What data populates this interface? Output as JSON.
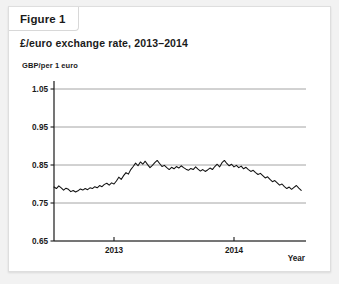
{
  "card": {
    "tab_label": "Figure 1",
    "title": "£/euro exchange rate, 2013–2014"
  },
  "colors": {
    "page_background": "#f2f2f2",
    "card_background": "#ffffff",
    "card_border": "#dedede",
    "gridline": "#9a9a9a",
    "axis": "#1a1a1a",
    "series_line": "#111111",
    "text": "#1a1a1a"
  },
  "chart_data": {
    "type": "line",
    "title": "£/euro exchange rate, 2013–2014",
    "subtitle": "",
    "xlabel": "Year",
    "ylabel": "GBP/per 1 euro",
    "ylim": [
      0.65,
      1.05
    ],
    "yticks": [
      0.65,
      0.75,
      0.85,
      0.95,
      1.05
    ],
    "ytick_labels": [
      "0.65",
      "0.75",
      "0.85",
      "0.95",
      "1.05"
    ],
    "xlim": [
      2012.5,
      2014.6
    ],
    "xticks": [
      2013,
      2014
    ],
    "xtick_labels": [
      "2013",
      "2014"
    ],
    "grid": true,
    "grid_axis": "y",
    "legend": false,
    "legend_position": "none",
    "series": [
      {
        "name": "GBP per 1 euro",
        "x": [
          2012.5,
          2012.52,
          2012.54,
          2012.56,
          2012.58,
          2012.6,
          2012.62,
          2012.64,
          2012.66,
          2012.68,
          2012.7,
          2012.72,
          2012.74,
          2012.76,
          2012.78,
          2012.8,
          2012.82,
          2012.84,
          2012.86,
          2012.88,
          2012.9,
          2012.92,
          2012.94,
          2012.96,
          2012.98,
          2013.0,
          2013.02,
          2013.04,
          2013.06,
          2013.08,
          2013.1,
          2013.12,
          2013.14,
          2013.16,
          2013.18,
          2013.2,
          2013.22,
          2013.24,
          2013.26,
          2013.28,
          2013.3,
          2013.32,
          2013.34,
          2013.36,
          2013.38,
          2013.4,
          2013.42,
          2013.44,
          2013.46,
          2013.48,
          2013.5,
          2013.52,
          2013.54,
          2013.56,
          2013.58,
          2013.6,
          2013.62,
          2013.64,
          2013.66,
          2013.68,
          2013.7,
          2013.72,
          2013.74,
          2013.76,
          2013.78,
          2013.8,
          2013.82,
          2013.84,
          2013.86,
          2013.88,
          2013.9,
          2013.92,
          2013.94,
          2013.96,
          2013.98,
          2014.0,
          2014.02,
          2014.04,
          2014.06,
          2014.08,
          2014.1,
          2014.12,
          2014.14,
          2014.16,
          2014.18,
          2014.2,
          2014.22,
          2014.24,
          2014.26,
          2014.28,
          2014.3,
          2014.32,
          2014.34,
          2014.36,
          2014.38,
          2014.4,
          2014.42,
          2014.44,
          2014.46,
          2014.48,
          2014.5,
          2014.52,
          2014.54,
          2014.56
        ],
        "y": [
          0.792,
          0.788,
          0.795,
          0.79,
          0.784,
          0.789,
          0.786,
          0.78,
          0.783,
          0.779,
          0.782,
          0.787,
          0.784,
          0.788,
          0.785,
          0.79,
          0.788,
          0.793,
          0.79,
          0.796,
          0.793,
          0.799,
          0.802,
          0.797,
          0.803,
          0.8,
          0.808,
          0.818,
          0.812,
          0.822,
          0.83,
          0.826,
          0.838,
          0.846,
          0.855,
          0.848,
          0.858,
          0.852,
          0.86,
          0.851,
          0.843,
          0.849,
          0.856,
          0.862,
          0.854,
          0.846,
          0.849,
          0.843,
          0.838,
          0.844,
          0.84,
          0.846,
          0.842,
          0.848,
          0.843,
          0.839,
          0.836,
          0.841,
          0.838,
          0.845,
          0.839,
          0.834,
          0.838,
          0.833,
          0.837,
          0.842,
          0.838,
          0.846,
          0.852,
          0.845,
          0.856,
          0.862,
          0.854,
          0.848,
          0.852,
          0.845,
          0.849,
          0.843,
          0.847,
          0.84,
          0.844,
          0.838,
          0.833,
          0.836,
          0.83,
          0.825,
          0.828,
          0.822,
          0.816,
          0.819,
          0.812,
          0.806,
          0.809,
          0.803,
          0.797,
          0.8,
          0.793,
          0.788,
          0.792,
          0.786,
          0.791,
          0.796,
          0.789,
          0.783
        ]
      }
    ]
  }
}
